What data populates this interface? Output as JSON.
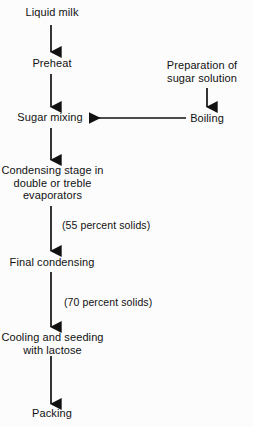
{
  "diagram": {
    "type": "flowchart",
    "background_color": "#fcfcfc",
    "line_color": "#111111",
    "text_color": "#111111",
    "nodes": [
      {
        "id": "liquid-milk",
        "label": "Liquid milk",
        "lines": [
          "Liquid milk"
        ]
      },
      {
        "id": "preheat",
        "label": "Preheat",
        "lines": [
          "Preheat"
        ]
      },
      {
        "id": "prep-sugar",
        "label": "Preparation of sugar solution",
        "lines": [
          "Preparation of",
          "sugar solution"
        ]
      },
      {
        "id": "boiling",
        "label": "Boiling",
        "lines": [
          "Boiling"
        ]
      },
      {
        "id": "sugar-mixing",
        "label": "Sugar mixing",
        "lines": [
          "Sugar mixing"
        ]
      },
      {
        "id": "condensing-stage",
        "label": "Condensing stage in double or treble evaporators",
        "lines": [
          "Condensing stage in",
          "double or  treble",
          "evaporators"
        ]
      },
      {
        "id": "final-condensing",
        "label": "Final condensing",
        "lines": [
          "Final condensing"
        ]
      },
      {
        "id": "cooling-seeding",
        "label": "Cooling and seeding with lactose",
        "lines": [
          "Cooling and seeding",
          "with  lactose"
        ]
      },
      {
        "id": "packing",
        "label": "Packing",
        "lines": [
          "Packing"
        ]
      }
    ],
    "edge_labels": [
      {
        "id": "solids-55",
        "text": "(55 percent solids)"
      },
      {
        "id": "solids-70",
        "text": "(70 percent solids)"
      }
    ],
    "edges": [
      {
        "from": "liquid-milk",
        "to": "preheat",
        "direction": "down"
      },
      {
        "from": "preheat",
        "to": "sugar-mixing",
        "direction": "down"
      },
      {
        "from": "prep-sugar",
        "to": "boiling",
        "direction": "down"
      },
      {
        "from": "boiling",
        "to": "sugar-mixing",
        "direction": "left"
      },
      {
        "from": "sugar-mixing",
        "to": "condensing-stage",
        "direction": "down"
      },
      {
        "from": "condensing-stage",
        "to": "final-condensing",
        "direction": "down",
        "label": "(55 percent solids)"
      },
      {
        "from": "final-condensing",
        "to": "cooling-seeding",
        "direction": "down",
        "label": "(70 percent solids)"
      },
      {
        "from": "cooling-seeding",
        "to": "packing",
        "direction": "down"
      }
    ]
  }
}
